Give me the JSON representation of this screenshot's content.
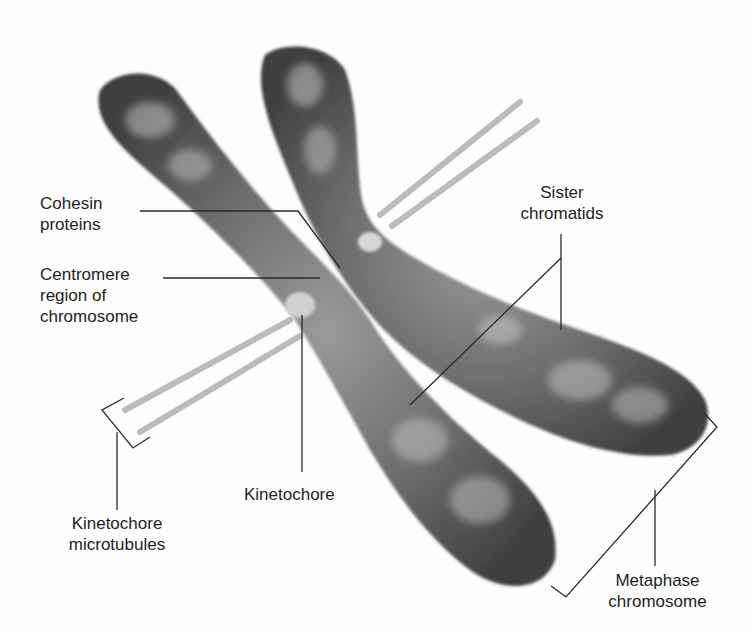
{
  "figure": {
    "subject": "Metaphase chromosome",
    "colors": {
      "background": "#fdfdfd",
      "chromosome_dark": "#4a4a4a",
      "chromosome_mid": "#6e6e6e",
      "chromosome_light": "#a8a8a8",
      "microtubule": "#b9b9b9",
      "kinetochore": "#cfcfcf",
      "leader_line": "#2a2a2a",
      "text": "#1e1e1e"
    }
  },
  "labels": {
    "cohesin": {
      "line1": "Cohesin",
      "line2": "proteins"
    },
    "centromere": {
      "line1": "Centromere",
      "line2": "region of",
      "line3": "chromosome"
    },
    "sister_chromatids": {
      "line1": "Sister",
      "line2": "chromatids"
    },
    "kinetochore": {
      "line1": "Kinetochore"
    },
    "kinetochore_microtubules": {
      "line1": "Kinetochore",
      "line2": "microtubules"
    },
    "metaphase_chromosome": {
      "line1": "Metaphase",
      "line2": "chromosome"
    }
  }
}
